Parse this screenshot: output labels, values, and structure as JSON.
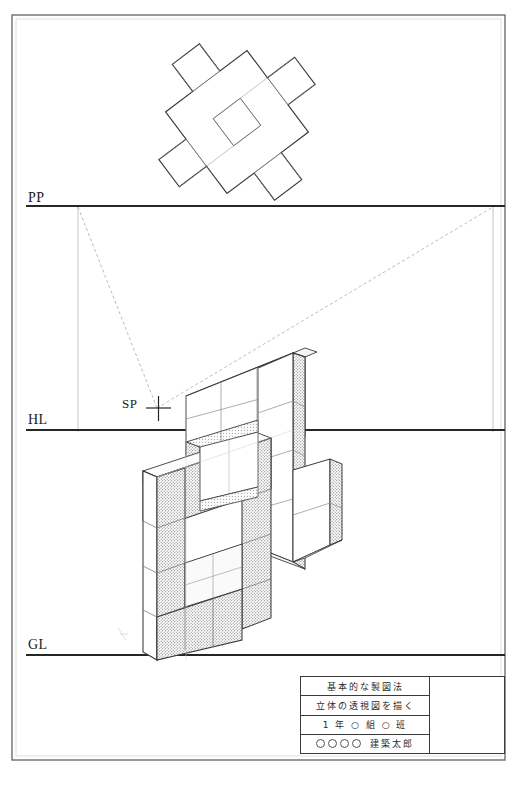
{
  "sheet": {
    "title": "基本的な製図法 — 立体の透視図を描く",
    "background_color": "#ffffff",
    "line_color": "#1a1a1a",
    "shade_color": "#b9b9b9",
    "construction_color": "#9a9a9a"
  },
  "reference_lines": {
    "pp": {
      "label": "PP",
      "name": "picture-plane",
      "y": 206
    },
    "hl": {
      "label": "HL",
      "name": "horizon-line",
      "y": 430
    },
    "gl": {
      "label": "GL",
      "name": "ground-line",
      "y": 655
    }
  },
  "station_point": {
    "label": "SP",
    "name": "station-point",
    "x": 157,
    "y": 408
  },
  "vertical_guides": [
    {
      "name": "left-measuring-line",
      "x": 78,
      "y1": 207,
      "y2": 432
    },
    {
      "name": "right-measuring-line",
      "x": 493,
      "y1": 207,
      "y2": 432
    }
  ],
  "sight_lines": [
    {
      "name": "sight-line-left",
      "x1": 157,
      "y1": 408,
      "x2": 78,
      "y2": 207
    },
    {
      "name": "sight-line-right",
      "x1": 157,
      "y1": 408,
      "x2": 493,
      "y2": 207
    }
  ],
  "plan_view": {
    "name": "rotated-cross-plan",
    "description": "Cross-shaped plan of unit cubes rotated about the station point axis",
    "rotation_deg": -37,
    "cell_size": 34,
    "origin_x": 237,
    "origin_y": 122,
    "cells": [
      [
        0,
        -2
      ],
      [
        0,
        -1
      ],
      [
        0,
        0
      ],
      [
        0,
        1
      ],
      [
        0,
        2
      ],
      [
        -1,
        0
      ],
      [
        -2,
        0
      ],
      [
        1,
        0
      ],
      [
        2,
        0
      ],
      [
        -1,
        1
      ],
      [
        1,
        -1
      ]
    ]
  },
  "perspective": {
    "name": "two-point-perspective-solid",
    "description": "Cross-shaped stacked cube assembly drawn in two-point perspective between HL and GL",
    "vanishing_points": {
      "left_x": -340,
      "right_x": 980,
      "y": 430
    }
  },
  "titleblock": {
    "name": "drawing-title-block",
    "rows": [
      {
        "name": "subject-row",
        "text": "基本的な製図法"
      },
      {
        "name": "task-row",
        "text": "立体の透視図を描く"
      },
      {
        "name": "class-row",
        "text": "1 年 ○ 組 ○ 班"
      }
    ],
    "name_row": {
      "name": "student-name-row",
      "circles": 4,
      "student_name": "建築太郎"
    },
    "right_cell": {
      "name": "blank-cell",
      "text": ""
    }
  },
  "border": {
    "name": "sheet-border",
    "outer": {
      "x": 12,
      "y": 15,
      "w": 493,
      "h": 745
    }
  }
}
